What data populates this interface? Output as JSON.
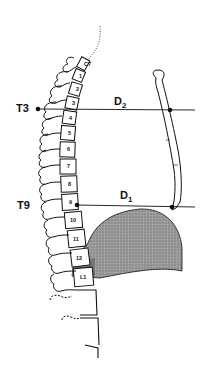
{
  "diagram": {
    "type": "anatomical-lateral-spine",
    "labels": {
      "upper_level": "T3",
      "lower_level": "T9",
      "upper_distance": {
        "letter": "D",
        "subscript": "2"
      },
      "lower_distance": {
        "letter": "D",
        "subscript": "1"
      }
    },
    "vertebrae": [
      "C7",
      "1",
      "2",
      "3",
      "4",
      "5",
      "6",
      "7",
      "8",
      "9",
      "10",
      "11",
      "12",
      "L1"
    ],
    "colors": {
      "line": "#111111",
      "shading": "#8c8c8c",
      "shading_dark": "#6e6e6e",
      "background": "#ffffff"
    }
  }
}
